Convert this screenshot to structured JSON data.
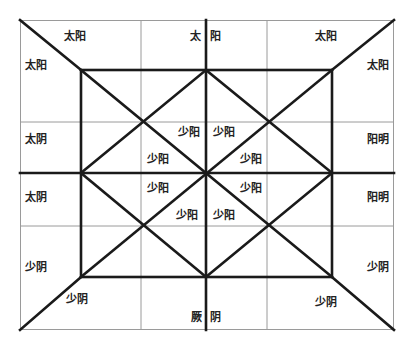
{
  "diagram": {
    "outer_rect": {
      "x1": 20,
      "y1": 20,
      "x2": 394,
      "y2": 330
    },
    "inner_rect": {
      "x1": 81,
      "y1": 70,
      "x2": 332,
      "y2": 277
    },
    "center": {
      "x": 206,
      "y": 173
    },
    "thin_vertical_lines": [
      141,
      267
    ],
    "thin_horizontal_lines": [
      122,
      226
    ],
    "colors": {
      "thin_line": "#9a9a9a",
      "heavy_line": "#1a1a1a",
      "text": "#222222"
    },
    "labels": {
      "top_left_a": "太阳",
      "top_left_b": "太阳",
      "top_center_left": "太",
      "top_center_right": "阳",
      "top_right_a": "太阳",
      "top_right_b": "太阳",
      "left_upper": "太阴",
      "left_lower": "太阴",
      "right_upper": "阳明",
      "right_lower": "阳明",
      "bottom_left_a": "少阴",
      "bottom_left_b": "少阴",
      "bottom_center_left": "厥",
      "bottom_center_right": "阴",
      "bottom_right_a": "少阴",
      "bottom_right_b": "少阴",
      "inner_ul_1": "少阳",
      "inner_ul_2": "少阳",
      "inner_ur_1": "少阳",
      "inner_ur_2": "少阳",
      "inner_ll_1": "少阳",
      "inner_ll_2": "少阳",
      "inner_lr_1": "少阳",
      "inner_lr_2": "少阳"
    }
  }
}
